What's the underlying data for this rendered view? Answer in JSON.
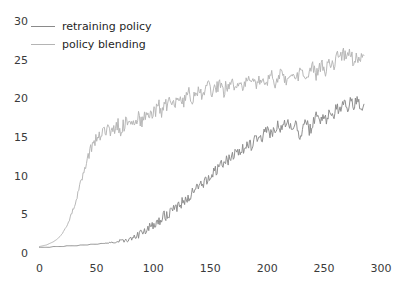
{
  "chart_data": {
    "type": "line",
    "title": "",
    "xlabel": "",
    "ylabel": "",
    "xlim": [
      0,
      300
    ],
    "ylim": [
      0,
      30
    ],
    "xticks": [
      0,
      50,
      100,
      150,
      200,
      250,
      300
    ],
    "yticks": [
      0,
      5,
      10,
      15,
      20,
      25,
      30
    ],
    "grid": false,
    "legend_position": "upper left",
    "series": [
      {
        "name": "retraining policy",
        "color": "#8a8a8a",
        "x": [
          0,
          3,
          6,
          9,
          12,
          15,
          18,
          21,
          24,
          27,
          30,
          33,
          36,
          39,
          42,
          45,
          48,
          51,
          54,
          57,
          60,
          63,
          66,
          69,
          72,
          75,
          78,
          81,
          84,
          87,
          90,
          93,
          96,
          99,
          102,
          105,
          108,
          111,
          114,
          117,
          120,
          123,
          126,
          129,
          132,
          135,
          138,
          141,
          144,
          147,
          150,
          153,
          156,
          159,
          162,
          165,
          168,
          171,
          174,
          177,
          180,
          183,
          186,
          189,
          192,
          195,
          198,
          201,
          204,
          207,
          210,
          213,
          216,
          219,
          222,
          225,
          228,
          231,
          234,
          237,
          240,
          243,
          246,
          249,
          252,
          255,
          258,
          261,
          264,
          267,
          270,
          273,
          276,
          279,
          282,
          285
        ],
        "values": [
          0.8,
          0.8,
          0.8,
          0.8,
          0.9,
          0.9,
          0.9,
          0.9,
          1.0,
          1.0,
          1.0,
          1.0,
          1.1,
          1.1,
          1.1,
          1.2,
          1.2,
          1.2,
          1.3,
          1.3,
          1.4,
          1.4,
          1.5,
          1.6,
          1.6,
          1.7,
          1.8,
          2.0,
          2.2,
          2.4,
          2.7,
          3.0,
          3.3,
          3.6,
          3.9,
          4.3,
          4.6,
          5.0,
          5.3,
          5.6,
          6.0,
          6.4,
          6.8,
          7.2,
          7.4,
          7.9,
          8.3,
          8.6,
          9.1,
          9.6,
          9.9,
          10.5,
          10.9,
          11.2,
          11.8,
          12.2,
          12.0,
          12.8,
          13.2,
          13.0,
          13.8,
          14.2,
          14.0,
          14.7,
          15.1,
          14.9,
          15.5,
          15.9,
          15.4,
          16.2,
          16.5,
          15.9,
          16.8,
          17.0,
          16.3,
          17.2,
          15.0,
          16.0,
          17.3,
          15.8,
          16.6,
          17.8,
          16.9,
          18.2,
          17.4,
          18.6,
          17.8,
          19.0,
          18.3,
          19.4,
          18.7,
          19.8,
          18.9,
          20.1,
          19.0,
          19.3
        ]
      },
      {
        "name": "policy blending",
        "color": "#b4b4b4",
        "x": [
          0,
          3,
          6,
          9,
          12,
          15,
          18,
          21,
          24,
          27,
          30,
          33,
          36,
          39,
          42,
          45,
          48,
          51,
          54,
          57,
          60,
          63,
          66,
          69,
          72,
          75,
          78,
          81,
          84,
          87,
          90,
          93,
          96,
          99,
          102,
          105,
          108,
          111,
          114,
          117,
          120,
          123,
          126,
          129,
          132,
          135,
          138,
          141,
          144,
          147,
          150,
          153,
          156,
          159,
          162,
          165,
          168,
          171,
          174,
          177,
          180,
          183,
          186,
          189,
          192,
          195,
          198,
          201,
          204,
          207,
          210,
          213,
          216,
          219,
          222,
          225,
          228,
          231,
          234,
          237,
          240,
          243,
          246,
          249,
          252,
          255,
          258,
          261,
          264,
          267,
          270,
          273,
          276,
          279,
          282,
          285
        ],
        "values": [
          0.9,
          1.0,
          1.1,
          1.3,
          1.5,
          1.8,
          2.2,
          2.8,
          3.6,
          4.6,
          5.9,
          7.4,
          9.0,
          10.6,
          12.2,
          13.5,
          14.5,
          15.2,
          15.0,
          15.6,
          16.0,
          15.4,
          16.2,
          16.6,
          15.9,
          16.8,
          17.2,
          16.5,
          17.4,
          17.8,
          17.0,
          18.0,
          18.4,
          17.6,
          18.6,
          19.0,
          18.2,
          19.2,
          19.6,
          18.8,
          19.8,
          20.2,
          19.4,
          20.4,
          20.8,
          19.9,
          20.9,
          21.3,
          20.4,
          21.3,
          21.6,
          20.7,
          21.6,
          21.9,
          21.0,
          21.8,
          22.1,
          21.2,
          22.0,
          22.3,
          21.4,
          22.2,
          22.5,
          21.6,
          22.4,
          22.7,
          21.8,
          22.6,
          22.9,
          22.0,
          22.8,
          23.1,
          22.2,
          23.0,
          23.3,
          22.4,
          23.2,
          23.6,
          22.6,
          23.5,
          24.0,
          23.0,
          24.2,
          24.6,
          23.6,
          25.0,
          24.4,
          25.4,
          24.8,
          26.0,
          25.2,
          25.8,
          24.6,
          25.4,
          24.9,
          25.6
        ]
      }
    ]
  },
  "legend": {
    "items": [
      {
        "label": "retraining policy",
        "color": "#8a8a8a"
      },
      {
        "label": "policy blending",
        "color": "#b4b4b4"
      }
    ]
  },
  "axes": {
    "ytick_labels": [
      "30",
      "25",
      "20",
      "15",
      "10",
      "5",
      "0"
    ],
    "xtick_labels": [
      "0",
      "50",
      "100",
      "150",
      "200",
      "250",
      "300"
    ]
  }
}
